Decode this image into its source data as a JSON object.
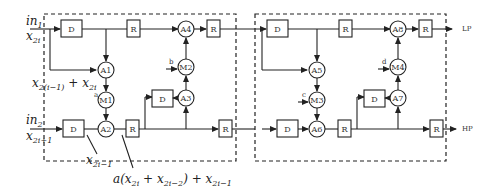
{
  "diagram": {
    "inputs": {
      "in1": {
        "name": "in",
        "sub": "1",
        "signal": "x",
        "signal_sub": "2i"
      },
      "in2": {
        "name": "in",
        "sub": "2",
        "signal": "x",
        "signal_sub": "2i+1"
      }
    },
    "outputs": {
      "lp": "LP",
      "hp": "HP"
    },
    "delay_label": "D",
    "register_label": "R",
    "adders": [
      "A1",
      "A2",
      "A3",
      "A4",
      "A5",
      "A6",
      "A7",
      "A8"
    ],
    "multipliers": [
      "M1",
      "M2",
      "M3",
      "M4"
    ],
    "coefficients": {
      "m1": "a",
      "m2": "b",
      "m3": "c",
      "m4": "d"
    },
    "annotations": {
      "a1_out": {
        "pre": "x",
        "sub1": "2(i−1)",
        "mid": " + x",
        "sub2": "2i"
      },
      "d_out": {
        "pre": "x",
        "sub1": "2i−1"
      },
      "a2_out": {
        "pre": "a(x",
        "sub1": "2i",
        "mid": " + x",
        "sub2": "2i−2",
        "post": ") + x",
        "sub3": "2i−1"
      }
    }
  }
}
